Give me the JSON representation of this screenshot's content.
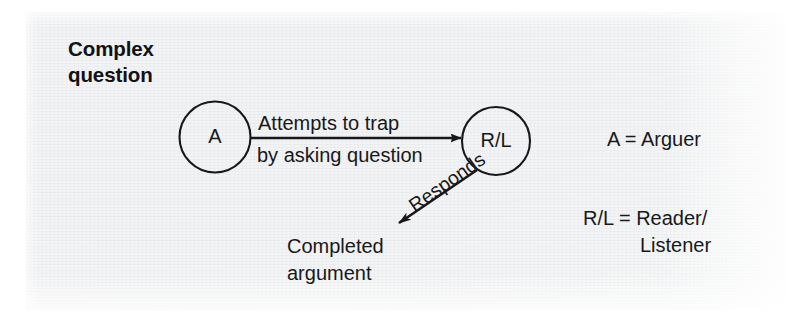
{
  "figure": {
    "title": "Complex\nquestion",
    "caption_type": "argument-flow diagram"
  },
  "nodes": [
    {
      "id": "arguer",
      "label": "A",
      "cx": 215,
      "cy": 137,
      "r": 35
    },
    {
      "id": "reader_listener",
      "label": "R/L",
      "cx": 496,
      "cy": 141,
      "r": 34
    }
  ],
  "edges": [
    {
      "id": "attempts",
      "from": "arguer",
      "to": "reader_listener",
      "label_line1": "Attempts to trap",
      "label_line2": "by asking question",
      "style": "straight-arrow"
    },
    {
      "id": "responds",
      "from": "reader_listener",
      "to": "completed_argument",
      "label": "Responds",
      "style": "diagonal-arrow"
    }
  ],
  "outcome": {
    "id": "completed_argument",
    "text": "Completed\nargument"
  },
  "legend": {
    "arguer": "A = Arguer",
    "reader_listener_line1": "R/L = Reader/",
    "reader_listener_line2": "Listener"
  },
  "colors": {
    "ink": "#18181a",
    "title_ink": "#121212",
    "paper": "#f3f4f5",
    "page": "#ffffff"
  }
}
